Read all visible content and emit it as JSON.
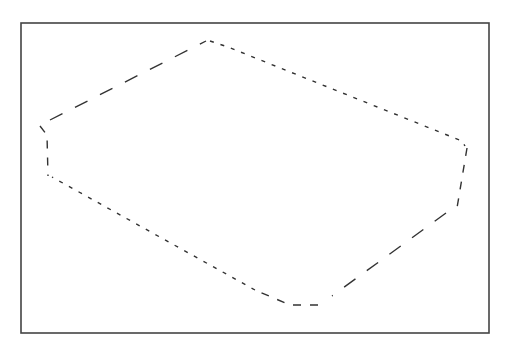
{
  "diagram": {
    "frame": {
      "x": 21,
      "y": 23,
      "width": 468,
      "height": 310,
      "stroke": "#444444"
    },
    "shape": {
      "stroke": "#333333",
      "segments": [
        {
          "name": "top-left-edge",
          "style": "long-dash",
          "points": [
            [
              50,
              120
            ],
            [
              206,
              41
            ]
          ]
        },
        {
          "name": "top-right-edge",
          "style": "dot-dash",
          "points": [
            [
              210,
              41
            ],
            [
              228,
              47
            ],
            [
              462,
              141
            ],
            [
              465,
              146
            ]
          ]
        },
        {
          "name": "right-side",
          "style": "dash",
          "points": [
            [
              467,
              148
            ],
            [
              457,
              208
            ]
          ]
        },
        {
          "name": "bottom-right-edge",
          "style": "long-dash",
          "points": [
            [
              446,
              213
            ],
            [
              332,
              296
            ]
          ]
        },
        {
          "name": "bottom-curve",
          "style": "dash",
          "points": [
            [
              318,
              305
            ],
            [
              290,
              305
            ],
            [
              255,
              290
            ]
          ]
        },
        {
          "name": "bottom-left-edge",
          "style": "dot-dash",
          "points": [
            [
              255,
              290
            ],
            [
              52,
              177
            ]
          ]
        },
        {
          "name": "left-side",
          "style": "dash",
          "points": [
            [
              40,
              126
            ],
            [
              47,
              135
            ],
            [
              48,
              176
            ]
          ]
        }
      ]
    }
  }
}
